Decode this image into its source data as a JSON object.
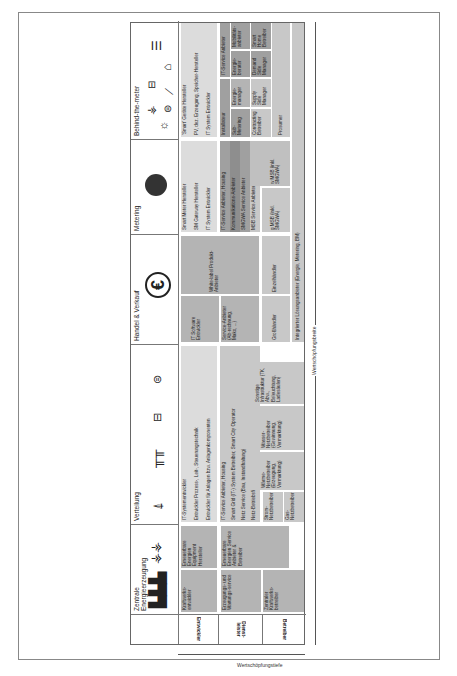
{
  "figure": {
    "axis_breite": "Wertschöpfungsbreite",
    "axis_tiefe": "Wertschöpfungstiefe",
    "roles": [
      "Entwickler",
      "Dienst-leister",
      "Betreiber"
    ],
    "columns": [
      {
        "label": "Zentrale Energieerzeugung",
        "icons": [
          "power-plant-cooling-towers-icon",
          "wind-turbines-icon"
        ]
      },
      {
        "label": "Verteilung",
        "icons": [
          "transmission-tower-icon",
          "utility-poles-icon",
          "heat-pump-icon",
          "electric-car-icon"
        ]
      },
      {
        "label": "Handel & Verkauf",
        "icons": [
          "euro-icon"
        ]
      },
      {
        "label": "Metering",
        "icons": [
          "smart-meter-icon"
        ]
      },
      {
        "label": "Behind-the-meter",
        "icons": [
          "sun-icon",
          "wind-turbine-icon",
          "electric-car-icon",
          "heat-pump-icon",
          "ev-charger-icon",
          "house-icon",
          "ladder-storage-icon"
        ]
      }
    ],
    "zentrale": {
      "kraftwerksentwickler": "Kraftwerks-entwickler",
      "ee_equipment": "Erneuerbare Energien Equipment Hersteller",
      "erzeugung_wartung": "Erzeugungs- und Wartungs-service",
      "ee_service": "Erneuerbare Energien Service Anbieter & Betreiber",
      "zentraler_betreiber": "Zentraler Kraftwerks-betreiber"
    },
    "verteilung": {
      "entwickler": [
        "IT-Systementwickler",
        "Entwickler Prozess-, Leit-, Steuerungstechnik",
        "Entwickler für Anlagen bzw. Anlagenkomponenten"
      ],
      "dienstleister": [
        "IT-Service Anbieter, Housing",
        "Smart Grid (IT-) System Betreiber, Smart City Operator",
        "Netz Service (Bau, Instandhaltung)",
        "Netz-Betriebsführer"
      ],
      "betreiber": {
        "strom": "Strom-Netzbetreiber",
        "gas": "Gas-Netzbetreiber",
        "waerme": "Wärme-Netzbetreiber (Erzeugung, Vermarktung)",
        "wasser": "Wasser-Netzbetreiber (Gewinnung, Vermarktung)",
        "sonstige": "Sonstige Infrastruktur (TK, Abw., Beleuchtung, Ladesäulen)"
      }
    },
    "handel": {
      "it_software": "IT Software Entwickler",
      "white_label": "White-label Produkt-Anbieter",
      "service_anbieter": "Service-Anbieter (Ab-rechnung, Mako, ...)",
      "grosshaendler": "Großhändler",
      "einzelhaendler": "Einzelhändler"
    },
    "metering": {
      "entwickler": [
        "Smart Meter Hersteller",
        "SM Gateway Hersteller",
        "IT System Entwickler"
      ],
      "dienstleister": [
        "IT-Service Anbieter, Housing",
        "Kommunikations-Anbieter",
        "SMGWA Service Anbieter",
        "MSB Service Anbieter"
      ],
      "gmsb": "g MSB (inkl. SMGWA)",
      "wmsb": "w MSB (inkl. SMGWA)"
    },
    "behind": {
      "entwickler": [
        "'Smart' Geräte Hersteller",
        "PV, dez. Erzeugung, Speicher-Hersteller",
        "IT System Entwickler"
      ],
      "installateur": "Installateur",
      "it_service": "IT-Service Anbieter",
      "sub_metering": "Sub-Metering",
      "energiemanager": "Energie-manager",
      "energieberater": "Energie-berater",
      "mobilitaet": "Mobilitäts-anbieter",
      "contracting": "Contracting Betreiber",
      "supply_side": "Supply Side Manager",
      "demand_side": "Demand Side Manager",
      "smart_home": "Smart Home Betreiber",
      "prosumer": "Prosumer"
    },
    "integrated": "Integrierter Lösungsanbieter (Energie, Metering, BM)"
  }
}
